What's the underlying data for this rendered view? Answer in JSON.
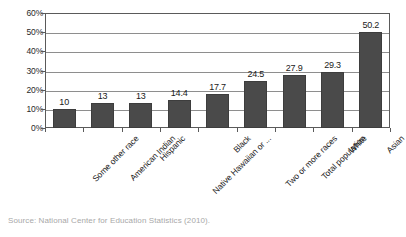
{
  "chart_data": {
    "type": "bar",
    "title": "",
    "subtitle": "",
    "xlabel": "",
    "ylabel": "",
    "ylim": [
      0,
      60
    ],
    "ytick_labels": [
      "0%",
      "10%",
      "20%",
      "30%",
      "40%",
      "50%",
      "60%"
    ],
    "ytick_values": [
      0,
      10,
      20,
      30,
      40,
      50,
      60
    ],
    "grid": true,
    "legend": false,
    "legend_position": "none",
    "categories": [
      "Some other race",
      "American Indian",
      "Hispanic",
      "Native Hawaiian or ...",
      "Black",
      "Two or more races",
      "Total population",
      "White",
      "Asian"
    ],
    "values": [
      10,
      13,
      13,
      14.4,
      17.7,
      24.5,
      27.9,
      29.3,
      50.2
    ],
    "value_labels": [
      "10",
      "13",
      "13",
      "14.4",
      "17.7",
      "24.5",
      "27.9",
      "29.3",
      "50.2"
    ],
    "bar_color": "#4a4a4a",
    "gridline_color": "#8e8e8e",
    "axis_color": "#5a5a5a"
  },
  "caption": {
    "source": "Source: National Center for Education Statistics (2010)."
  }
}
